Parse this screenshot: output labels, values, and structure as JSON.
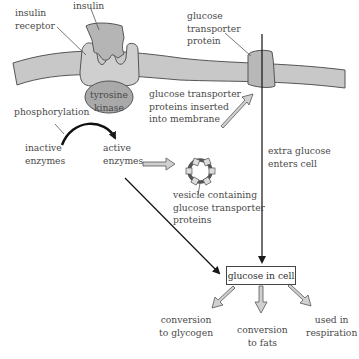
{
  "diagram": {
    "colors": {
      "membrane_fill": "#c8c8c8",
      "protein_fill": "#b5b5b5",
      "kinase_fill": "#a9a9a9",
      "outline": "#555555",
      "arrow_fill": "#d0d0d0",
      "line": "#1a1a1a",
      "text": "#4a4a4a"
    },
    "labels": {
      "insulin": "insulin",
      "insulin_receptor": "insulin\nreceptor",
      "tyrosine_kinase": "tyrosine\nkinase",
      "glucose_transporter_protein": "glucose\ntransporter\nprotein",
      "transporters_inserted": "glucose transporter\nproteins inserted\ninto membrane",
      "phosphorylation": "phosphorylation",
      "inactive_enzymes": "inactive\nenzymes",
      "active_enzymes": "active\nenzymes",
      "vesicle": "vesicle containing\nglucose transporter\nproteins",
      "extra_glucose": "extra glucose\nenters cell",
      "glucose_in_cell": "glucose in cell",
      "conversion_glycogen": "conversion\nto glycogen",
      "conversion_fats": "conversion\nto fats",
      "used_respiration": "used in\nrespiration"
    }
  }
}
